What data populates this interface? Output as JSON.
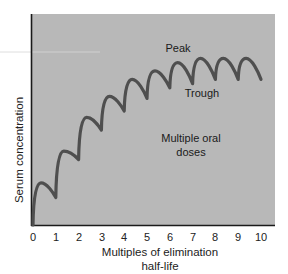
{
  "chart_data": {
    "type": "line",
    "title": "",
    "xlabel": "Multiples of elimination half-life",
    "xlabel_lines": [
      "Multiples of elimination",
      "half-life"
    ],
    "ylabel": "Serum concentration",
    "xlim": [
      0,
      10.5
    ],
    "ylim": [
      0,
      100
    ],
    "x_ticks": [
      0,
      1,
      2,
      3,
      4,
      5,
      6,
      7,
      8,
      9,
      10
    ],
    "y_ticks": [],
    "grid": false,
    "legend": null,
    "series": [
      {
        "name": "Multiple oral doses",
        "x": [
          0,
          0.35,
          1.0,
          1.35,
          2.0,
          2.35,
          3.0,
          3.35,
          4.0,
          4.35,
          5.0,
          5.35,
          6.0,
          6.35,
          7.0,
          7.35,
          8.0,
          8.35,
          9.0,
          9.35,
          10.0
        ],
        "y": [
          0,
          20,
          13,
          35,
          31,
          51,
          45,
          61,
          54,
          69,
          60,
          73,
          65,
          77,
          67,
          79,
          69,
          79,
          69,
          79,
          69
        ]
      }
    ],
    "annotations": [
      {
        "text": "Peak",
        "x": 6.6,
        "y": 87
      },
      {
        "text": "Trough",
        "x": 7.5,
        "y": 59
      },
      {
        "text": "Multiple oral",
        "x": 7.1,
        "y": 40
      },
      {
        "text": "doses",
        "x": 7.1,
        "y": 33
      }
    ],
    "colors": {
      "plot_background": "#b7b7b7",
      "curve": "#4f4f4f",
      "axis": "#1a1a1a"
    }
  },
  "labels": {
    "ylabel": "Serum concentration",
    "xlabel_line1": "Multiples of elimination",
    "xlabel_line2": "half-life",
    "peak": "Peak",
    "trough": "Trough",
    "doses_line1": "Multiple oral",
    "doses_line2": "doses",
    "ticks": [
      "0",
      "1",
      "2",
      "3",
      "4",
      "5",
      "6",
      "7",
      "8",
      "9",
      "10"
    ]
  }
}
